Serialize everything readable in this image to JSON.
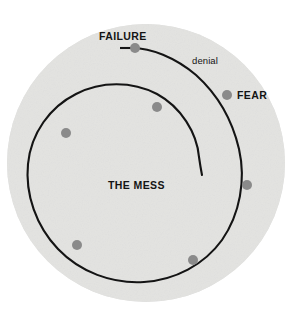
{
  "diagram": {
    "background_color": "#ffffff",
    "disc_color": "#e3e3e1",
    "line_color": "#141414",
    "dot_color": "#8a8a8a",
    "text_color": "#141414",
    "disc": {
      "cx": 146,
      "cy": 163,
      "r": 139
    },
    "labels": {
      "failure": "FAILURE",
      "denial": "denial",
      "fear": "FEAR",
      "the_mess": "THE MESS"
    },
    "nodes": [
      {
        "name": "failure-node",
        "label": "FAILURE",
        "cx": 135,
        "cy": 48,
        "r": 5.0
      },
      {
        "name": "fear-node",
        "label": "FEAR",
        "cx": 227,
        "cy": 95,
        "r": 5.0
      },
      {
        "name": "right-node",
        "label": "",
        "cx": 247,
        "cy": 185,
        "r": 5.0
      },
      {
        "name": "bottom-right-node",
        "label": "",
        "cx": 193,
        "cy": 260,
        "r": 5.0
      },
      {
        "name": "bottom-left-node",
        "label": "",
        "cx": 77,
        "cy": 245,
        "r": 5.0
      },
      {
        "name": "left-node",
        "label": "",
        "cx": 66,
        "cy": 133,
        "r": 5.0
      },
      {
        "name": "inner-top-node",
        "label": "",
        "cx": 157,
        "cy": 107,
        "r": 5.0
      }
    ],
    "spiral": {
      "name": "failure-spiral-path",
      "stroke_width": 2.1,
      "start_tick": {
        "x1": 120,
        "y1": 48,
        "x2": 130,
        "y2": 48
      },
      "path": "M 130 48 C 150 47 176 58 196 75 C 216 93 232 119 239 149 C 246 180 240 214 222 240 C 204 265 175 280 144 282 C 112 284 80 272 58 249 C 36 226 25 194 28 164 C 31 133 50 107 76 94 C 101 81 132 81 157 94 C 181 107 197 133 199 157 C 200 164 201 170 202 175"
    }
  }
}
